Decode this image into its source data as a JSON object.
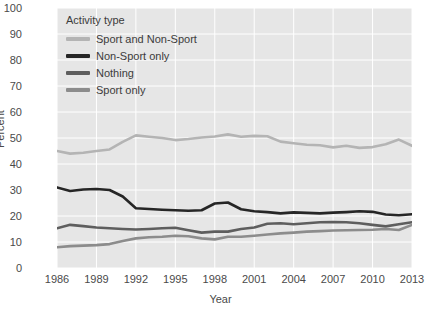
{
  "chart_data": {
    "type": "line",
    "title": "",
    "xlabel": "Year",
    "ylabel": "Percent",
    "ylim": [
      0,
      100
    ],
    "xlim": [
      1986,
      2013
    ],
    "grid": true,
    "legend_position": "top-left",
    "legend_title": "Activity type",
    "yticks": [
      100,
      90,
      80,
      70,
      60,
      50,
      40,
      30,
      20,
      10,
      0
    ],
    "xticks": [
      1986,
      1989,
      1992,
      1995,
      1998,
      2001,
      2004,
      2007,
      2010,
      2013
    ],
    "x": [
      1986,
      1987,
      1988,
      1989,
      1990,
      1991,
      1992,
      1993,
      1994,
      1995,
      1996,
      1997,
      1998,
      1999,
      2000,
      2001,
      2002,
      2003,
      2004,
      2005,
      2006,
      2007,
      2008,
      2009,
      2010,
      2011,
      2012,
      2013
    ],
    "series": [
      {
        "name": "Sport and Non-Sport",
        "color": "#b4b4b4",
        "values": [
          45.0,
          44.0,
          44.3,
          45.0,
          45.6,
          48.5,
          51.0,
          50.5,
          50.0,
          49.2,
          49.6,
          50.2,
          50.6,
          51.4,
          50.5,
          50.8,
          50.7,
          48.6,
          48.0,
          47.4,
          47.2,
          46.4,
          47.0,
          46.2,
          46.5,
          47.6,
          49.4,
          47.0
        ]
      },
      {
        "name": "Non-Sport only",
        "color": "#262626",
        "values": [
          31.0,
          29.6,
          30.2,
          30.4,
          30.0,
          27.5,
          23.0,
          22.7,
          22.4,
          22.2,
          22.0,
          22.2,
          24.8,
          25.2,
          22.6,
          21.8,
          21.5,
          21.0,
          21.4,
          21.2,
          21.0,
          21.3,
          21.5,
          21.8,
          21.6,
          20.6,
          20.3,
          20.7
        ]
      },
      {
        "name": "Nothing",
        "color": "#5e5e5e",
        "values": [
          15.3,
          16.6,
          16.1,
          15.6,
          15.3,
          15.0,
          14.8,
          15.0,
          15.3,
          15.5,
          14.5,
          13.6,
          14.0,
          14.0,
          15.0,
          15.6,
          17.0,
          17.2,
          16.8,
          17.2,
          17.6,
          17.7,
          17.6,
          17.2,
          16.6,
          16.0,
          16.8,
          17.6
        ]
      },
      {
        "name": "Sport only",
        "color": "#8c8c8c",
        "values": [
          8.0,
          8.4,
          8.6,
          8.8,
          9.2,
          10.4,
          11.4,
          11.8,
          12.0,
          12.4,
          12.2,
          11.4,
          11.0,
          12.0,
          12.0,
          12.4,
          12.9,
          13.3,
          13.6,
          14.0,
          14.2,
          14.4,
          14.5,
          14.6,
          14.7,
          15.0,
          14.6,
          16.6
        ]
      }
    ]
  },
  "legend": {
    "title": "Activity type",
    "items": [
      {
        "label": "Sport and Non-Sport",
        "color": "#b4b4b4"
      },
      {
        "label": "Non-Sport only",
        "color": "#262626"
      },
      {
        "label": "Nothing",
        "color": "#5e5e5e"
      },
      {
        "label": "Sport only",
        "color": "#8c8c8c"
      }
    ]
  },
  "axes": {
    "x_title": "Year",
    "y_title": "Percent"
  }
}
